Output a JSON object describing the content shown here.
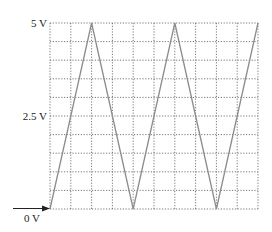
{
  "chart_data": {
    "type": "line",
    "title": "",
    "xlabel": "",
    "ylabel": "",
    "grid": {
      "on": true,
      "rows": 10,
      "cols": 10,
      "style": "dotted"
    },
    "ylim": [
      0,
      5
    ],
    "xlim": [
      0,
      10
    ],
    "y_tick_labels": [
      {
        "value": 5,
        "label": "5 V"
      },
      {
        "value": 2.5,
        "label": "2.5 V"
      },
      {
        "value": 0,
        "label": "0 V"
      }
    ],
    "series": [
      {
        "name": "triangle-wave",
        "x": [
          0,
          2,
          4,
          6,
          8,
          10
        ],
        "y": [
          0,
          5,
          0,
          5,
          0,
          5
        ]
      }
    ],
    "annotations": [
      {
        "type": "arrow",
        "description": "Ground reference marker pointing at 0 V level",
        "label": "0 V"
      }
    ],
    "colors": {
      "trace": "#8c8c8c",
      "grid": "#555555",
      "text": "#222222"
    }
  },
  "labels": {
    "top": "5 V",
    "mid": "2.5 V",
    "bottom": "0 V"
  }
}
